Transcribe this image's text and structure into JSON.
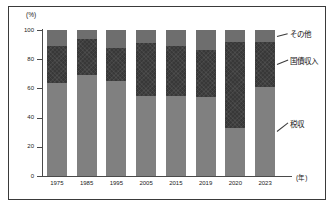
{
  "chart_data": {
    "type": "bar",
    "subtype": "stacked-percentage-column",
    "title": "",
    "xlabel": "(年)",
    "ylabel": "(%)",
    "ylim": [
      0,
      100
    ],
    "yticks": [
      0,
      20,
      40,
      60,
      80,
      100
    ],
    "grid": false,
    "legend_position": "right-callout",
    "categories": [
      "1975",
      "1985",
      "1995",
      "2005",
      "2015",
      "2019",
      "2020",
      "2023"
    ],
    "series": [
      {
        "name": "税収",
        "values": [
          64,
          69,
          65,
          55,
          55,
          54,
          33,
          61
        ]
      },
      {
        "name": "国債収入",
        "values": [
          25,
          25,
          23,
          36,
          34,
          32,
          59,
          31
        ]
      },
      {
        "name": "その他",
        "values": [
          11,
          6,
          12,
          9,
          11,
          14,
          8,
          8
        ]
      }
    ],
    "colors": {
      "税収": "#808080",
      "国債収入": "#383838",
      "その他": "#6e6e6e"
    },
    "annotations": [
      {
        "text": "その他",
        "target_series": "その他"
      },
      {
        "text": "国債収入",
        "target_series": "国債収入"
      },
      {
        "text": "税収",
        "target_series": "税収"
      }
    ]
  },
  "axes": {
    "y_unit": "(%)",
    "x_unit": "(年)",
    "y_tick_labels": [
      "100",
      "80",
      "60",
      "40",
      "20",
      "0"
    ]
  },
  "callouts": {
    "other": "その他",
    "bond": "国債収入",
    "tax": "税収"
  }
}
